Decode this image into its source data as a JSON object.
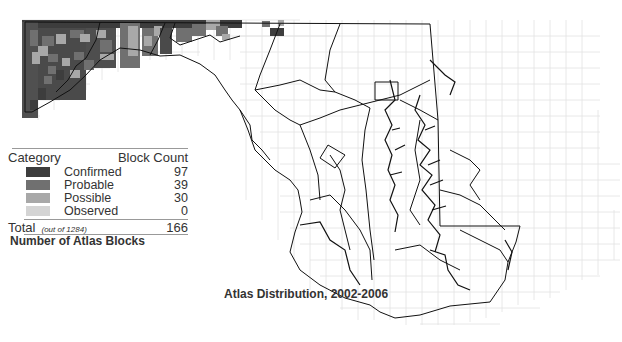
{
  "legend": {
    "header": {
      "category": "Category",
      "count": "Block Count"
    },
    "rows": [
      {
        "label": "Confirmed",
        "count": "97",
        "color": "#3d3d3d"
      },
      {
        "label": "Probable",
        "count": "39",
        "color": "#707070"
      },
      {
        "label": "Possible",
        "count": "30",
        "color": "#a8a8a8"
      },
      {
        "label": "Observed",
        "count": "0",
        "color": "#d4d4d4"
      }
    ],
    "total": {
      "label": "Total",
      "note": "(out of 1284)",
      "count": "166"
    }
  },
  "subtitle": "Number of Atlas Blocks",
  "map_title": "Atlas Distribution, 2002-2006",
  "colors": {
    "confirmed": "#3d3d3d",
    "probable": "#707070",
    "possible": "#a8a8a8",
    "observed": "#d4d4d4",
    "grid": "#e2e2e2",
    "boundary": "#111111"
  }
}
